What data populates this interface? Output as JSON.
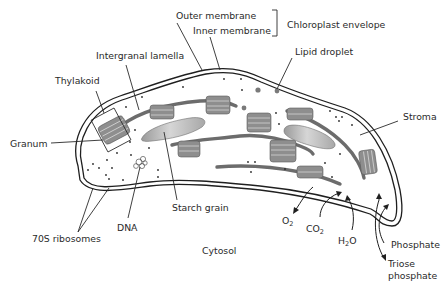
{
  "labels": {
    "outer_membrane": "Outer membrane",
    "inner_membrane": "Inner membrane",
    "chloroplast_envelope": "Chloroplast envelope",
    "intergranal_lamella": "Intergranal lamella",
    "lipid_droplet": "Lipid droplet",
    "thylakoid": "Thylakoid",
    "granum": "Granum",
    "stroma": "Stroma",
    "dna": "DNA",
    "starch_grain": "Starch grain",
    "ribosomes": "70S ribosomes",
    "cytosol": "Cytosol",
    "o2": "O",
    "o2_sub": "2",
    "co2": "CO",
    "co2_sub": "2",
    "h2o_h": "H",
    "h2o_sub": "2",
    "h2o_o": "O",
    "phosphate": "Phosphate",
    "triose_line1": "Triose",
    "triose_line2": "phosphate"
  },
  "colors": {
    "stroma_fill": "#f1f1f1",
    "membrane": "#1f1f1f",
    "thylakoid": "#8e8e8e",
    "lamella": "#6c6c6c",
    "starch": "#b9b9b9",
    "text": "#2a2a2a"
  }
}
